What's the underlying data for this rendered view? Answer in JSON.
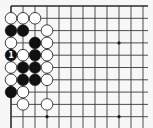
{
  "diagram": {
    "type": "go-board-partial",
    "colors": {
      "background": "#f7f7f7",
      "line": "#3a3a3a",
      "black_stone": "#111111",
      "white_stone": "#ffffff",
      "label_on_black": "#ffffff"
    },
    "grid": {
      "visible_columns": 12,
      "visible_rows": 11,
      "origin_x": 11,
      "origin_y": 6,
      "spacing_x": 12.0,
      "spacing_y": 12.3,
      "top_edge": true,
      "left_edge": true
    },
    "hoshi": [
      {
        "col": 9,
        "row": 3
      },
      {
        "col": 3,
        "row": 9
      },
      {
        "col": 9,
        "row": 9
      }
    ],
    "stones": [
      {
        "col": 0,
        "row": 1,
        "color": "white"
      },
      {
        "col": 1,
        "row": 1,
        "color": "white"
      },
      {
        "col": 2,
        "row": 1,
        "color": "white"
      },
      {
        "col": 0,
        "row": 2,
        "color": "black"
      },
      {
        "col": 1,
        "row": 2,
        "color": "black"
      },
      {
        "col": 3,
        "row": 2,
        "color": "white"
      },
      {
        "col": 0,
        "row": 3,
        "color": "white"
      },
      {
        "col": 2,
        "row": 3,
        "color": "black"
      },
      {
        "col": 3,
        "row": 3,
        "color": "white"
      },
      {
        "col": 0,
        "row": 4,
        "color": "black",
        "label": "1"
      },
      {
        "col": 1,
        "row": 4,
        "color": "white"
      },
      {
        "col": 2,
        "row": 4,
        "color": "black"
      },
      {
        "col": 3,
        "row": 4,
        "color": "white"
      },
      {
        "col": 0,
        "row": 5,
        "color": "white"
      },
      {
        "col": 1,
        "row": 5,
        "color": "black"
      },
      {
        "col": 2,
        "row": 5,
        "color": "black"
      },
      {
        "col": 3,
        "row": 5,
        "color": "white"
      },
      {
        "col": 0,
        "row": 6,
        "color": "white"
      },
      {
        "col": 1,
        "row": 6,
        "color": "black"
      },
      {
        "col": 2,
        "row": 6,
        "color": "black"
      },
      {
        "col": 3,
        "row": 6,
        "color": "white"
      },
      {
        "col": 0,
        "row": 7,
        "color": "black"
      },
      {
        "col": 1,
        "row": 7,
        "color": "white"
      },
      {
        "col": 1,
        "row": 8,
        "color": "white"
      },
      {
        "col": 3,
        "row": 8,
        "color": "white"
      }
    ],
    "stone_radius": 5.8
  }
}
